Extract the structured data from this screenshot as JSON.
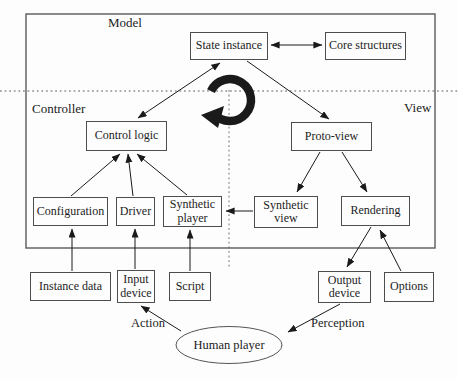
{
  "diagram": {
    "title_regions": {
      "model": "Model",
      "controller": "Controller",
      "view": "View"
    },
    "nodes": {
      "state_instance": {
        "label": "State instance"
      },
      "core_structures": {
        "label": "Core structures"
      },
      "control_logic": {
        "label": "Control logic"
      },
      "proto_view": {
        "label": "Proto-view"
      },
      "configuration": {
        "label": "Configuration"
      },
      "driver": {
        "label": "Driver"
      },
      "synthetic_player": {
        "label": "Synthetic player"
      },
      "synthetic_view": {
        "label": "Synthetic view"
      },
      "rendering": {
        "label": "Rendering"
      },
      "instance_data": {
        "label": "Instance data"
      },
      "input_device": {
        "label": "Input device"
      },
      "script": {
        "label": "Script"
      },
      "output_device": {
        "label": "Output device"
      },
      "options": {
        "label": "Options"
      },
      "human_player": {
        "label": "Human player"
      }
    },
    "edge_labels": {
      "action": "Action",
      "perception": "Perception"
    },
    "edges": [
      {
        "from": "state_instance",
        "to": "core_structures",
        "style": "double-arrow"
      },
      {
        "from": "control_logic",
        "to": "state_instance",
        "style": "double-arrow"
      },
      {
        "from": "state_instance",
        "to": "proto_view",
        "style": "arrow"
      },
      {
        "from": "configuration",
        "to": "control_logic",
        "style": "arrow"
      },
      {
        "from": "driver",
        "to": "control_logic",
        "style": "arrow"
      },
      {
        "from": "synthetic_player",
        "to": "control_logic",
        "style": "arrow"
      },
      {
        "from": "proto_view",
        "to": "synthetic_view",
        "style": "arrow"
      },
      {
        "from": "proto_view",
        "to": "rendering",
        "style": "arrow"
      },
      {
        "from": "synthetic_view",
        "to": "synthetic_player",
        "style": "arrow"
      },
      {
        "from": "rendering",
        "to": "output_device",
        "style": "arrow"
      },
      {
        "from": "options",
        "to": "rendering",
        "style": "arrow"
      },
      {
        "from": "instance_data",
        "to": "configuration",
        "style": "arrow"
      },
      {
        "from": "input_device",
        "to": "driver",
        "style": "arrow"
      },
      {
        "from": "script",
        "to": "synthetic_player",
        "style": "arrow"
      },
      {
        "from": "human_player",
        "to": "input_device",
        "style": "arrow",
        "label": "Action"
      },
      {
        "from": "output_device",
        "to": "human_player",
        "style": "arrow",
        "label": "Perception"
      }
    ],
    "icons": {
      "cycle": "rotation-cycle-arrow"
    },
    "colors": {
      "line": "#1a1a1a",
      "border": "#4d4d4d",
      "dotted": "#919191",
      "background": "#fdfdfd",
      "text": "#1c1c1c"
    }
  }
}
